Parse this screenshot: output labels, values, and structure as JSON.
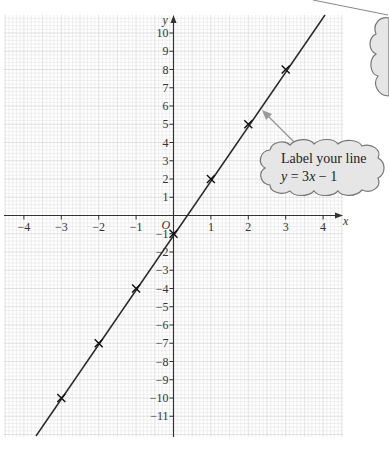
{
  "chart_data": {
    "type": "line",
    "title": "",
    "xlabel": "x",
    "ylabel": "y",
    "origin_label": "O",
    "xlim": [
      -4.5,
      4.5
    ],
    "ylim": [
      -12,
      11
    ],
    "x_ticks": [
      -4,
      -3,
      -2,
      -1,
      1,
      2,
      3,
      4
    ],
    "y_ticks": [
      10,
      9,
      8,
      7,
      6,
      5,
      4,
      3,
      2,
      1,
      -1,
      -2,
      -3,
      -4,
      -5,
      -6,
      -7,
      -8,
      -9,
      -10,
      -11
    ],
    "grid": true,
    "series": [
      {
        "name": "y = 3x - 1",
        "equation": "y = 3x - 1",
        "x": [
          -3,
          -2,
          -1,
          0,
          1,
          2,
          3
        ],
        "values": [
          -10,
          -7,
          -4,
          -1,
          2,
          5,
          8
        ],
        "marker": "x"
      }
    ],
    "annotations": [
      {
        "text_line1": "Label your line",
        "text_line2": "y = 3x − 1",
        "shape": "cloud",
        "points_to": "line"
      }
    ]
  },
  "callout": {
    "line1": "Label your line",
    "line2_var": "y",
    "line2_rest": " = 3",
    "line2_x": "x",
    "line2_end": " − 1"
  },
  "colors": {
    "grid_minor": "#e4e4e4",
    "grid_major": "#cfcfcf",
    "axis": "#333333",
    "line": "#2a2a2a",
    "cloud_fill": "#e6e6e6",
    "cloud_stroke": "#777777",
    "arrow": "#9a9a9a"
  }
}
